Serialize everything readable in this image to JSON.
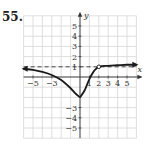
{
  "problem": {
    "number": "55."
  },
  "chart_data": {
    "type": "line",
    "title": "",
    "xlabel": "x",
    "ylabel": "y",
    "xlim": [
      -6,
      6
    ],
    "ylim": [
      -6,
      6
    ],
    "grid": true,
    "x_ticks": [
      -5,
      -3,
      1,
      2,
      3,
      4,
      5
    ],
    "x_tick_labels": [
      "-5",
      "-3",
      "1",
      "2",
      "3",
      "4",
      "5"
    ],
    "y_ticks": [
      5,
      4,
      3,
      2,
      1,
      -3,
      -4,
      -5
    ],
    "y_tick_labels": [
      "5",
      "4",
      "3",
      "2",
      "1",
      "-3",
      "-4",
      "-5"
    ],
    "asymptotes": [
      {
        "type": "horizontal",
        "y": 1,
        "style": "dashed"
      }
    ],
    "series": [
      {
        "name": "f(x)",
        "points": [
          [
            -6,
            0.8
          ],
          [
            -5,
            0.7
          ],
          [
            -4,
            0.5
          ],
          [
            -3,
            0.2
          ],
          [
            -2,
            -0.3
          ],
          [
            -1,
            -1.1
          ],
          [
            -0.5,
            -1.6
          ],
          [
            0,
            -2
          ],
          [
            0.5,
            -1.3
          ],
          [
            1,
            -0.2
          ],
          [
            1.5,
            0.6
          ],
          [
            2,
            1
          ],
          [
            3,
            1.1
          ],
          [
            4,
            1.15
          ],
          [
            5,
            1.2
          ],
          [
            6,
            1.2
          ]
        ],
        "minimum": [
          0,
          -2
        ],
        "open_circle": [
          2,
          1
        ],
        "left_end": "arrow",
        "right_end": "arrow"
      }
    ],
    "colors": {
      "curve": "#1a1a1a",
      "grid": "#d6d6d6",
      "axis": "#333333"
    }
  }
}
